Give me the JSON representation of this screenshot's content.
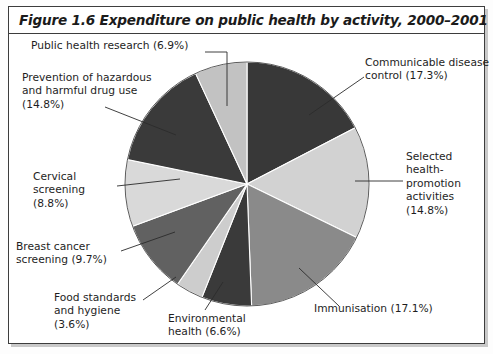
{
  "figure": {
    "title": "Figure 1.6 Expenditure on public health by activity, 2000–2001"
  },
  "chart_data": {
    "type": "pie",
    "title": "Figure 1.6 Expenditure on public health by activity, 2000–2001",
    "xlabel": "",
    "ylabel": "",
    "units": "percent",
    "legend": "labels with leader lines placed around the pie",
    "start_angle_deg": 0,
    "direction": "clockwise",
    "categories": [
      "Communicable disease control",
      "Selected health-promotion activities",
      "Immunisation",
      "Environmental health",
      "Food standards and hygiene",
      "Breast cancer screening",
      "Cervical screening",
      "Prevention of hazardous and harmful drug use",
      "Public health research"
    ],
    "values": [
      17.3,
      14.8,
      17.1,
      6.6,
      3.6,
      9.7,
      8.8,
      14.8,
      6.9
    ],
    "colors": [
      "#383838",
      "#d2d2d2",
      "#8a8a8a",
      "#3a3a3a",
      "#cdcdcd",
      "#616161",
      "#d9d9d9",
      "#3a3a3a",
      "#c2c2c2"
    ],
    "slices": [
      {
        "label": "Communicable disease control",
        "value": 17.3,
        "color": "#383838"
      },
      {
        "label": "Selected health-promotion activities",
        "value": 14.8,
        "color": "#d2d2d2"
      },
      {
        "label": "Immunisation",
        "value": 17.1,
        "color": "#8a8a8a"
      },
      {
        "label": "Environmental health",
        "value": 6.6,
        "color": "#3a3a3a"
      },
      {
        "label": "Food standards and hygiene",
        "value": 3.6,
        "color": "#cdcdcd"
      },
      {
        "label": "Breast cancer screening",
        "value": 9.7,
        "color": "#616161"
      },
      {
        "label": "Cervical screening",
        "value": 8.8,
        "color": "#d9d9d9"
      },
      {
        "label": "Prevention of hazardous and harmful drug use",
        "value": 14.8,
        "color": "#3a3a3a"
      },
      {
        "label": "Public health research",
        "value": 6.9,
        "color": "#c2c2c2"
      }
    ]
  },
  "labels": {
    "public_health_research": "Public health research (6.9%)",
    "prevention_drug_use": "Prevention of hazardous\nand harmful drug use\n(14.8%)",
    "cervical_screening": "Cervical\nscreening\n(8.8%)",
    "breast_cancer_screening": "Breast cancer\nscreening (9.7%)",
    "food_standards": "Food standards\nand hygiene\n(3.6%)",
    "environmental_health": "Environmental\nhealth (6.6%)",
    "immunisation": "Immunisation (17.1%)",
    "selected_health_promotion": "Selected\nhealth-\npromotion\nactivities\n(14.8%)",
    "communicable_disease": "Communicable disease\ncontrol (17.3%)"
  }
}
